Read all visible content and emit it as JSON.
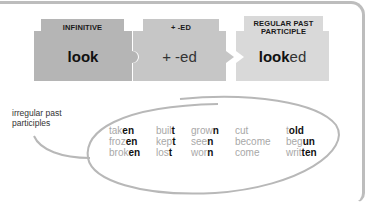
{
  "pieces": [
    {
      "header": "INFINITIVE",
      "word_bold": "look",
      "word_light": "",
      "color": "#b5b5b5"
    },
    {
      "header": "+ -ED",
      "word_bold": "",
      "word_light": "+ -ed",
      "color": "#c6c6c6"
    },
    {
      "header_line1": "REGULAR PAST",
      "header_line2": "PARTICIPLE",
      "word_bold": "look",
      "word_light": "ed",
      "color": "#d9d9d9"
    }
  ],
  "callout": {
    "line1": "irregular past",
    "line2": "participles"
  },
  "irregular": {
    "columns": [
      [
        {
          "stem": "tak",
          "ending": "en"
        },
        {
          "stem": "froz",
          "ending": "en"
        },
        {
          "stem": "brok",
          "ending": "en"
        }
      ],
      [
        {
          "stem": "buil",
          "ending": "t"
        },
        {
          "stem": "kep",
          "ending": "t"
        },
        {
          "stem": "los",
          "ending": "t"
        }
      ],
      [
        {
          "stem": "grow",
          "ending": "n"
        },
        {
          "stem": "see",
          "ending": "n"
        },
        {
          "stem": "wor",
          "ending": "n"
        }
      ],
      [
        {
          "stem": "cut",
          "ending": ""
        },
        {
          "stem": "become",
          "ending": ""
        },
        {
          "stem": "come",
          "ending": ""
        }
      ],
      [
        {
          "stem": "t",
          "ending": "old"
        },
        {
          "stem": "beg",
          "ending": "un"
        },
        {
          "stem": "writ",
          "ending": "ten"
        }
      ]
    ]
  },
  "colors": {
    "frame": "#bdbdbd",
    "stroke": "#b8b8b8",
    "stem_text": "#a8a8a8",
    "ending_text": "#111111"
  }
}
